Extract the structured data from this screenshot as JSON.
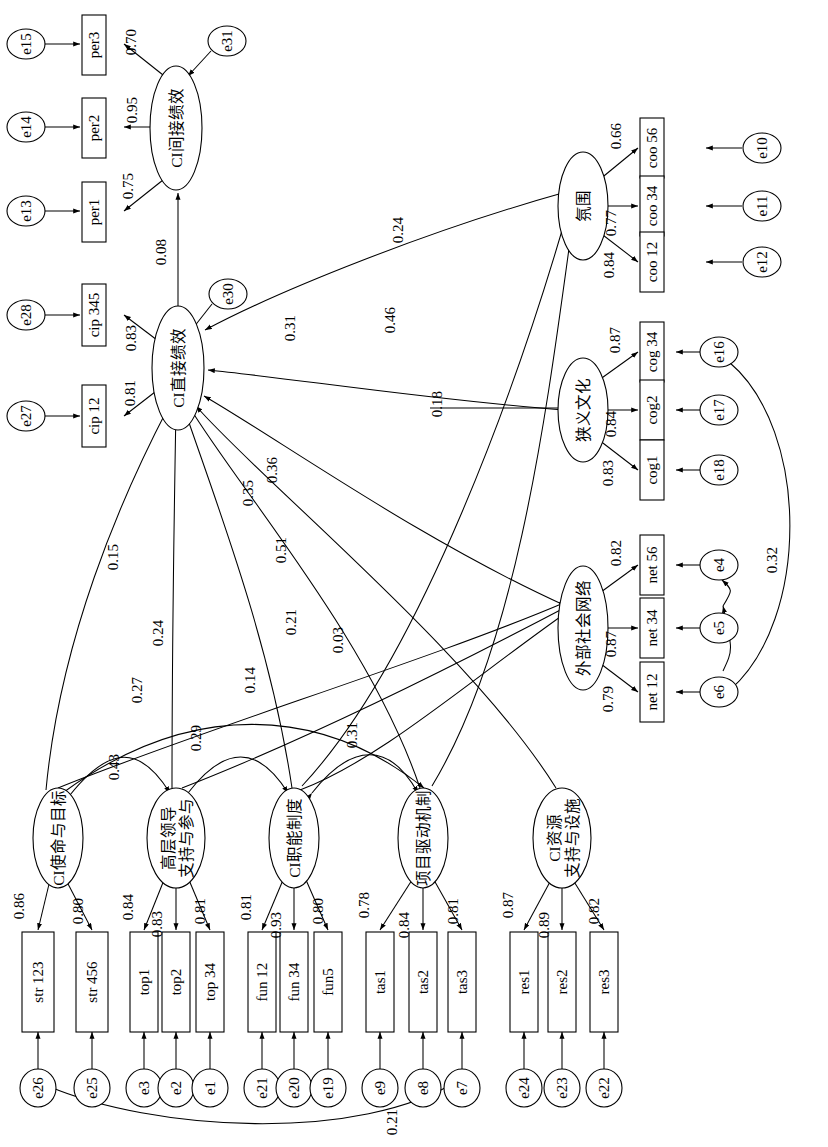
{
  "diagram": {
    "orientation": "rotated-90-ccw",
    "type": "sem-path-diagram"
  },
  "observed": {
    "per3": "per3",
    "per2": "per2",
    "per1": "per1",
    "cip345": "cip 345",
    "cip12": "cip 12",
    "coo56": "coo 56",
    "coo34": "coo 34",
    "coo12": "coo 12",
    "cog34": "cog 34",
    "cog2": "cog2",
    "cog1": "cog1",
    "net56": "net 56",
    "net34": "net 34",
    "net12": "net 12",
    "str123": "str 123",
    "str456": "str 456",
    "top1": "top1",
    "top2": "top2",
    "top34": "top 34",
    "fun12": "fun 12",
    "fun34": "fun 34",
    "fun5": "fun5",
    "tas1": "tas1",
    "tas2": "tas2",
    "tas3": "tas3",
    "res1": "res1",
    "res2": "res2",
    "res3": "res3"
  },
  "errors": {
    "e15": "e15",
    "e14": "e14",
    "e13": "e13",
    "e31": "e31",
    "e30": "e30",
    "e28": "e28",
    "e27": "e27",
    "e10": "e10",
    "e11": "e11",
    "e12": "e12",
    "e16": "e16",
    "e17": "e17",
    "e18": "e18",
    "e4": "e4",
    "e5": "e5",
    "e6": "e6",
    "e26": "e26",
    "e25": "e25",
    "e3": "e3",
    "e2": "e2",
    "e1": "e1",
    "e21": "e21",
    "e20": "e20",
    "e19": "e19",
    "e9": "e9",
    "e8": "e8",
    "e7": "e7",
    "e24": "e24",
    "e23": "e23",
    "e22": "e22"
  },
  "latents": {
    "indirect_perf": "CI间接绩效",
    "direct_perf": "CI直接绩效",
    "climate": "氛围",
    "narrow_culture": "狭义文化",
    "ext_network": "外部社会网络",
    "mission": "CI使命与目标",
    "top_support_l1": "高层领导",
    "top_support_l2": "支持与参与",
    "fun_system": "CI职能制度",
    "project_mech": "项目驱动机制",
    "resource_l1": "CI资源",
    "resource_l2": "支持与设施"
  },
  "loadings": {
    "per3": "0.70",
    "per2": "0.95",
    "per1": "0.75",
    "cip345": "0.83",
    "cip12": "0.81",
    "coo56": "0.66",
    "coo34": "0.77",
    "coo12": "0.84",
    "cog34": "0.87",
    "cog2": "0.84",
    "cog1": "0.83",
    "net56": "0.82",
    "net34": "0.87",
    "net12": "0.79",
    "str123": "0.86",
    "str456": "0.80",
    "top1": "0.84",
    "top2": "0.83",
    "top34": "0.81",
    "fun12": "0.81",
    "fun34": "0.93",
    "fun5": "0.80",
    "tas1": "0.78",
    "tas2": "0.84",
    "tas3": "0.81",
    "res1": "0.87",
    "res2": "0.89",
    "res3": "0.82"
  },
  "structural_paths": {
    "direct_to_indirect": "0.08",
    "climate_to_direct": "0.31",
    "culture_to_direct": "0.18",
    "network_to_direct": "0.36",
    "mission_to_direct": "0.15",
    "top_to_direct": "0.24",
    "fun_to_direct": "0.35",
    "project_to_direct": "0.51",
    "resource_to_direct": "0.21",
    "to_climate_a": "0.24",
    "to_climate_b": "0.46",
    "to_network_a": "0.27",
    "to_network_b": "0.14",
    "to_network_c": "0.03"
  },
  "covariances": {
    "mission_top": "0.43",
    "top_fun": "0.29",
    "fun_project": "0.31",
    "e16_e6": "0.32",
    "e7_e26": "0.21"
  }
}
